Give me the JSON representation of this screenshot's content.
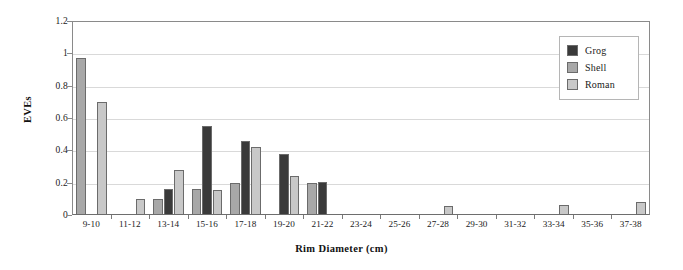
{
  "chart_data": {
    "type": "bar",
    "title": "",
    "xlabel": "Rim Diameter (cm)",
    "ylabel": "EVEs",
    "ylim": [
      0,
      1.2
    ],
    "ytick_labels": [
      "0",
      "0.2",
      "0.4",
      "0.6",
      "0.8",
      "1",
      "1.2"
    ],
    "ytick_values": [
      0,
      0.2,
      0.4,
      0.6,
      0.8,
      1.0,
      1.2
    ],
    "grid": "horizontal",
    "legend_position": "top-right",
    "categories": [
      "9-10",
      "11-12",
      "13-14",
      "15-16",
      "17-18",
      "19-20",
      "21-22",
      "23-24",
      "25-26",
      "27-28",
      "29-30",
      "31-32",
      "33-34",
      "35-36",
      "37-38"
    ],
    "series": [
      {
        "name": "Grog",
        "color": "#3a3a3a",
        "values": [
          0,
          0,
          0.16,
          0.55,
          0.455,
          0.375,
          0.205,
          0,
          0,
          0,
          0,
          0,
          0,
          0,
          0
        ]
      },
      {
        "name": "Shell",
        "color": "#a8a8a8",
        "values": [
          0.97,
          0,
          0.1,
          0.16,
          0.195,
          0,
          0.195,
          0,
          0,
          0,
          0,
          0,
          0,
          0,
          0
        ]
      },
      {
        "name": "Roman",
        "color": "#c8c8c8",
        "values": [
          0.7,
          0.1,
          0.28,
          0.155,
          0.42,
          0.24,
          0,
          0,
          0,
          0.055,
          0,
          0,
          0.06,
          0,
          0.08
        ]
      }
    ]
  },
  "legend": {
    "items": [
      {
        "label": "Grog"
      },
      {
        "label": "Shell"
      },
      {
        "label": "Roman"
      }
    ]
  },
  "axes": {
    "y_title": "EVEs",
    "x_title": "Rim Diameter (cm)"
  }
}
